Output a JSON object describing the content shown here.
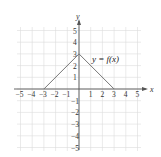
{
  "chart_data": {
    "type": "line",
    "title": "",
    "xlabel": "x",
    "ylabel": "y",
    "xlim": [
      -5,
      5
    ],
    "ylim": [
      -5,
      5
    ],
    "grid": true,
    "x_ticks": [
      "-5",
      "-4",
      "-3",
      "-2",
      "-1",
      "1",
      "2",
      "3",
      "4",
      "5"
    ],
    "y_ticks": [
      "5",
      "4",
      "3",
      "2",
      "1",
      "-1",
      "-2",
      "-3",
      "-4",
      "-5"
    ],
    "series": [
      {
        "name": "y = f(x)",
        "x": [
          -3,
          0,
          3
        ],
        "y": [
          0,
          3,
          0
        ]
      }
    ],
    "annotations": [
      {
        "text": "y = f(x)",
        "x": 2.3,
        "y": 2.7
      }
    ],
    "colors": {
      "line": "#777777",
      "grid": "#dcdcdc",
      "axis": "#555555"
    }
  },
  "labels": {
    "x_axis": "x",
    "y_axis": "y",
    "function": "y = f(x)"
  }
}
